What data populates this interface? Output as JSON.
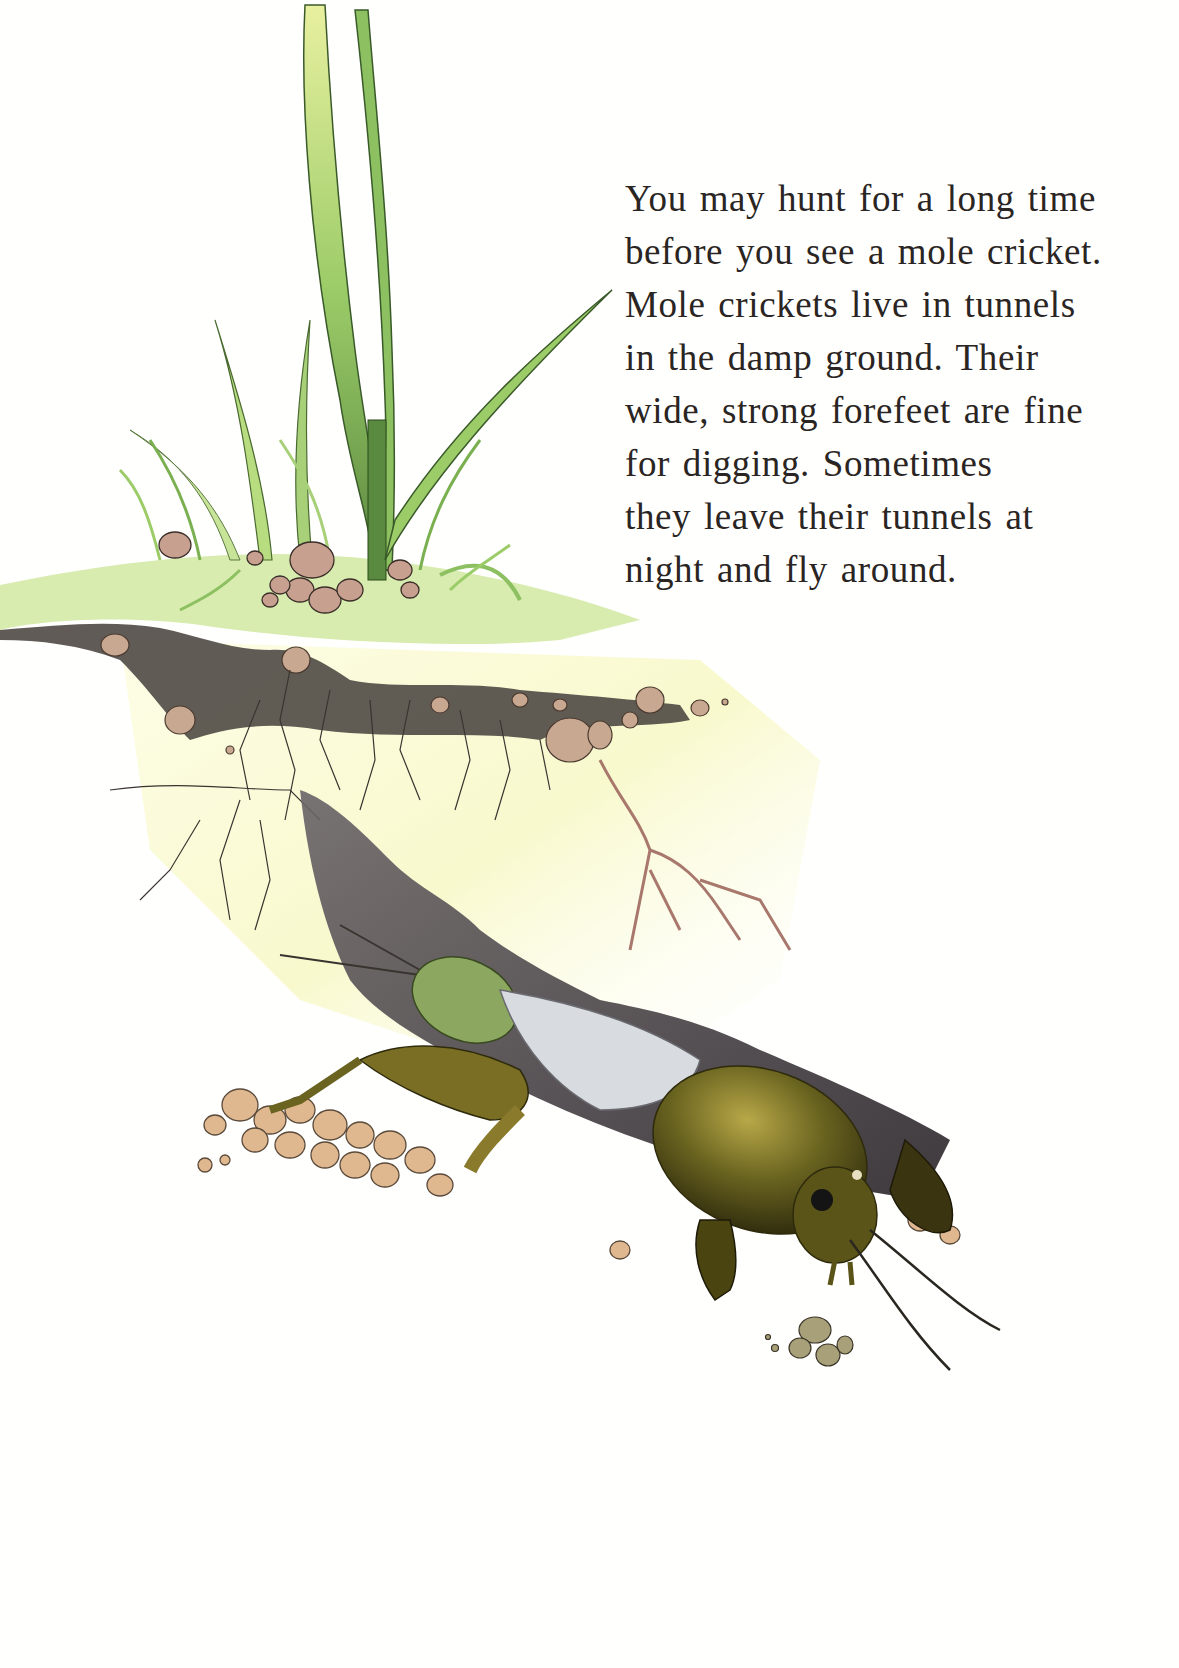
{
  "page": {
    "type": "illustrated-book-page",
    "background_color": "#fffffe"
  },
  "text": {
    "lines": [
      "You may hunt for a long time",
      "before you see a mole cricket.",
      "Mole crickets live in tunnels",
      "in the damp ground. Their",
      "wide, strong forefeet are fine",
      "for digging. Sometimes",
      "they leave their tunnels at",
      "night and fly around."
    ],
    "color": "#2a2522"
  },
  "illustration": {
    "subject": "mole-cricket-emerging-from-tunnel",
    "elements": [
      "grass-blades",
      "pebbles",
      "soil-layer",
      "roots",
      "tunnel",
      "mole-cricket"
    ],
    "colors": {
      "grass_light": "#d8e890",
      "grass_mid": "#8cc060",
      "grass_dark": "#4a7a3a",
      "ground_surface": "#d8ecb0",
      "soil_dark": "#4a4440",
      "subsoil": "#fafad0",
      "root_pink": "#c8968c",
      "cricket_body": "#6a6420",
      "cricket_dark": "#3a3410",
      "wing": "#d8dce0",
      "abdomen": "#8ca860",
      "pebble": "#c8a890"
    }
  }
}
